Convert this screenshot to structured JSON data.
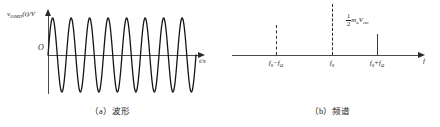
{
  "figure": {
    "panels": [
      {
        "id": "waveform",
        "caption": "（a）波形",
        "y_axis_label": "v",
        "y_axis_label_sub": "SSMD",
        "y_axis_label_rest": "(t)/V",
        "x_axis_label": "t/s",
        "origin_label": "O",
        "waveform": {
          "type": "constant-amplitude-sinusoid",
          "cycles": 8,
          "amplitude": 1.0,
          "description": "单边带调幅波形，等幅正弦振荡"
        }
      },
      {
        "id": "spectrum",
        "caption": "（b）频谱",
        "x_axis_label": "f",
        "amplitude_annotation": {
          "numerator": "1",
          "denominator": "2",
          "symbol": "m",
          "symbol_sub": "a",
          "symbol2": "V",
          "symbol2_sub": "cm"
        },
        "ticks": [
          {
            "label_main": "f",
            "label_sub": "0",
            "label_op": "−",
            "label_main2": "f",
            "label_sub2": "Ω",
            "line_style": "dashed",
            "height": 0.58,
            "present": false
          },
          {
            "label_main": "f",
            "label_sub": "0",
            "label_op": "",
            "label_main2": "",
            "label_sub2": "",
            "line_style": "dashed",
            "height": 1.0,
            "present": false
          },
          {
            "label_main": "f",
            "label_sub": "0",
            "label_op": "+",
            "label_main2": "f",
            "label_sub2": "Ω",
            "line_style": "solid",
            "height": 0.66,
            "present": true
          }
        ]
      }
    ]
  },
  "chart_data": {
    "type": "line",
    "title": "",
    "panels": [
      {
        "name": "(a) 波形 waveform",
        "type": "line",
        "xlabel": "t/s",
        "ylabel": "v_SSMD(t)/V",
        "description": "等幅正弦波，约8个周期，幅度恒定",
        "cycles": 8,
        "amplitude": 1.0
      },
      {
        "name": "(b) 频谱 spectrum",
        "type": "bar",
        "xlabel": "f",
        "ylabel": "",
        "categories": [
          "f0-fΩ",
          "f0",
          "f0+fΩ"
        ],
        "values": [
          0,
          0,
          0.66
        ],
        "line_styles": [
          "dashed",
          "dashed",
          "solid"
        ],
        "annotations": [
          "(1/2)·m_a·V_cm over f0+fΩ line"
        ]
      }
    ]
  }
}
